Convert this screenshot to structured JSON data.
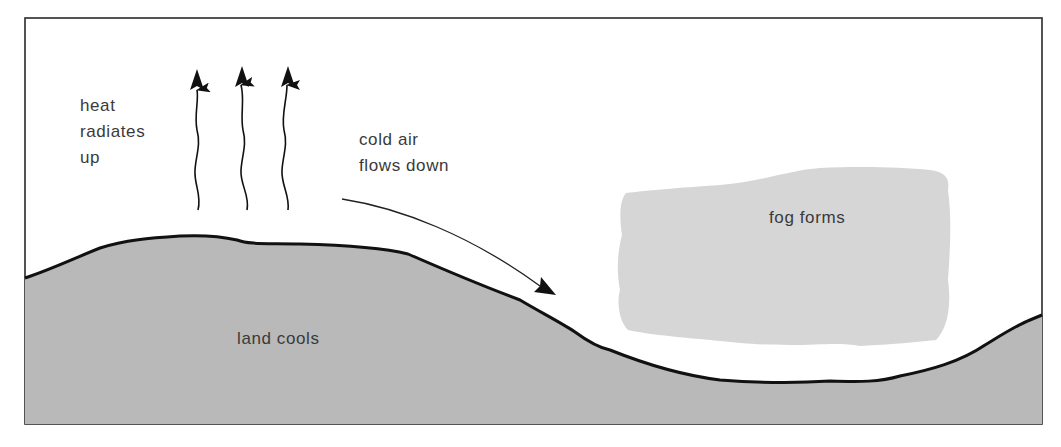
{
  "diagram": {
    "type": "process illustration",
    "topic": "formation of radiation / valley fog",
    "labels": {
      "heat": "heat\nradiates\nup",
      "cold_air": "cold air\nflows down",
      "fog": "fog forms",
      "land": "land cools"
    },
    "elements": [
      {
        "id": "heat-arrows",
        "count": 3,
        "style": "wavy arrows pointing up"
      },
      {
        "id": "cold-air-arrow",
        "count": 1,
        "style": "curved arrow pointing down-slope"
      },
      {
        "id": "fog-cloud",
        "style": "light grey irregular patch over valley"
      },
      {
        "id": "land",
        "style": "grey hill on left, valley, rising slope on right"
      }
    ],
    "colors": {
      "background": "#ffffff",
      "frame": "#2a2a2a",
      "land_fill": "#b9b9b9",
      "fog_fill": "#d6d6d6",
      "outline": "#111111",
      "text": "#3a3a3a"
    }
  }
}
